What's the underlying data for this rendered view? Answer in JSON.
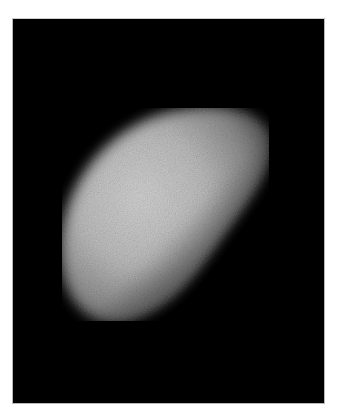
{
  "image": {
    "subject": "planet in gibbous phase (grainy telescope photo)",
    "description": "Bright, grainy gibbous planetary disk on a black sky background",
    "colors": {
      "background": "#ffffff",
      "sky": "#000000",
      "planet_bright": "#cfcfcf",
      "planet_mid": "#9a9a9a",
      "frame_border": "#b8b8b8"
    }
  }
}
